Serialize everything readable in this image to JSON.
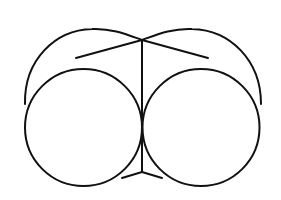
{
  "diagram": {
    "type": "geometric-line-drawing",
    "stroke_color": "#111111",
    "background": "#ffffff",
    "shapes": {
      "left_circle": {
        "cx": 83.5,
        "cy": 127.5,
        "r": 58.5
      },
      "right_circle": {
        "cx": 201,
        "cy": 127.5,
        "r": 58.5
      },
      "apex": {
        "x": 142,
        "y": 40
      },
      "bottom_vertex": {
        "x": 142,
        "y": 172
      }
    }
  }
}
